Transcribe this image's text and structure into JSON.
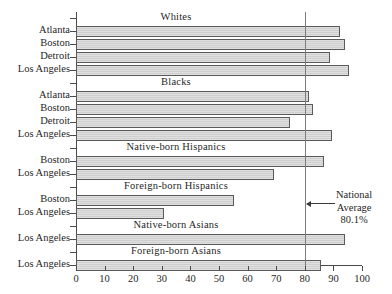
{
  "chart_data": {
    "type": "bar",
    "orientation": "horizontal",
    "title": "",
    "xlabel": "",
    "ylabel": "",
    "xlim": [
      0,
      100
    ],
    "xticks": [
      0,
      10,
      20,
      30,
      40,
      50,
      60,
      70,
      80,
      90,
      100
    ],
    "grid": false,
    "legend": null,
    "bar_color": "#cfcfcf",
    "bar_edge_color": "#5a5a5a",
    "groups": [
      {
        "title": "Whites",
        "categories": [
          "Atlanta",
          "Boston",
          "Detroit",
          "Los Angeles"
        ],
        "values": [
          92.2,
          93.9,
          88.7,
          95.6
        ]
      },
      {
        "title": "Blacks",
        "categories": [
          "Atlanta",
          "Boston",
          "Detroit",
          "Los Angeles"
        ],
        "values": [
          81.6,
          83.0,
          74.9,
          89.6
        ]
      },
      {
        "title": "Native-born Hispanics",
        "categories": [
          "Boston",
          "Los Angeles"
        ],
        "values": [
          86.6,
          69.1
        ]
      },
      {
        "title": "Foreign-born Hispanics",
        "categories": [
          "Boston",
          "Los Angeles"
        ],
        "values": [
          55.1,
          30.8
        ]
      },
      {
        "title": "Native-born Asians",
        "categories": [
          "Los Angeles"
        ],
        "values": [
          94.2
        ]
      },
      {
        "title": "Foreign-born Asians",
        "categories": [
          "Los Angeles"
        ],
        "values": [
          85.6
        ]
      }
    ],
    "annotations": [
      {
        "name": "national-average",
        "value": 80.1,
        "lines": [
          "National",
          "Average",
          "80.1%"
        ],
        "line_color": "#7c7c7c"
      }
    ]
  }
}
